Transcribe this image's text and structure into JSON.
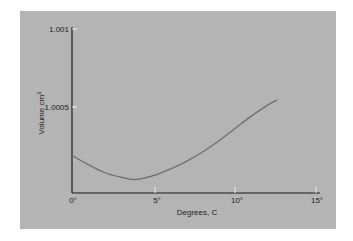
{
  "chart_data": {
    "type": "line",
    "title": "",
    "xlabel": "Degrees, C",
    "ylabel": "Volume cm3",
    "xlim": [
      0,
      15
    ],
    "ylim": [
      0.99995,
      1.001
    ],
    "x_ticks": [
      "0°",
      "5°",
      "10°",
      "15°"
    ],
    "y_ticks": [
      "1.0005",
      "1.001"
    ],
    "grid": false,
    "legend": null,
    "series": [
      {
        "name": "Volume of water",
        "x": [
          0,
          1,
          2,
          3,
          3.9,
          5,
          6,
          7,
          8,
          9,
          10,
          11,
          12,
          12.6
        ],
        "y": [
          1.00019,
          1.00013,
          1.00008,
          1.00005,
          1.000035,
          1.00006,
          1.0001,
          1.00015,
          1.00021,
          1.00028,
          1.00036,
          1.00044,
          1.00051,
          1.000545
        ]
      }
    ]
  },
  "colors": {
    "panel": "#b4b4b4",
    "axis": "#1a1a1a",
    "curve": "#6e6e6e",
    "tick": "#eeeeee"
  }
}
